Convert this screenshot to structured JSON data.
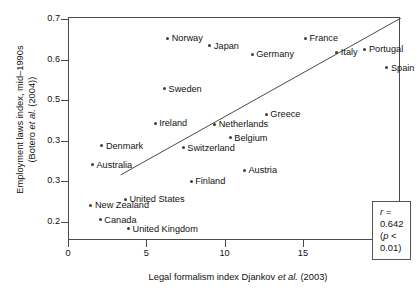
{
  "chart_data": {
    "type": "scatter",
    "title": "",
    "xlabel": "Legal formalism index Djankov et al. (2003)",
    "ylabel_line1": "Employment laws index, mid–1990s",
    "ylabel_line2": "(Botero et al. (2004))",
    "xlim": [
      0,
      21.2
    ],
    "ylim": [
      0.155,
      0.705
    ],
    "xticks": [
      0,
      5,
      10,
      15,
      20
    ],
    "xtick_labels": [
      "0",
      "5",
      "10",
      "15",
      "20"
    ],
    "yticks": [
      0.2,
      0.3,
      0.4,
      0.5,
      0.6,
      0.7
    ],
    "ytick_labels": [
      "0.2",
      "0.3",
      "0.3",
      "0.5",
      "0.6",
      "0.7"
    ],
    "grid": false,
    "legend": null,
    "points": [
      {
        "label": "Norway",
        "x": 6.3,
        "y": 0.655,
        "side": "right"
      },
      {
        "label": "Japan",
        "x": 9.0,
        "y": 0.637,
        "side": "right"
      },
      {
        "label": "France",
        "x": 15.1,
        "y": 0.655,
        "side": "right"
      },
      {
        "label": "Portugal",
        "x": 18.9,
        "y": 0.628,
        "side": "right"
      },
      {
        "label": "Italy",
        "x": 17.1,
        "y": 0.62,
        "side": "right"
      },
      {
        "label": "Germany",
        "x": 11.7,
        "y": 0.615,
        "side": "right"
      },
      {
        "label": "Spain",
        "x": 20.3,
        "y": 0.582,
        "side": "right"
      },
      {
        "label": "Sweden",
        "x": 6.1,
        "y": 0.53,
        "side": "right"
      },
      {
        "label": "Greece",
        "x": 12.6,
        "y": 0.468,
        "side": "right"
      },
      {
        "label": "Ireland",
        "x": 5.5,
        "y": 0.445,
        "side": "right"
      },
      {
        "label": "Netherlands",
        "x": 9.3,
        "y": 0.443,
        "side": "right"
      },
      {
        "label": "Belgium",
        "x": 10.3,
        "y": 0.41,
        "side": "right"
      },
      {
        "label": "Denmark",
        "x": 2.1,
        "y": 0.39,
        "side": "right"
      },
      {
        "label": "Switzerland",
        "x": 7.3,
        "y": 0.385,
        "side": "right"
      },
      {
        "label": "Australia",
        "x": 1.5,
        "y": 0.343,
        "side": "right"
      },
      {
        "label": "Austria",
        "x": 11.2,
        "y": 0.33,
        "side": "right"
      },
      {
        "label": "Finland",
        "x": 7.8,
        "y": 0.302,
        "side": "right"
      },
      {
        "label": "United States",
        "x": 3.6,
        "y": 0.258,
        "side": "right"
      },
      {
        "label": "New Zealand",
        "x": 1.4,
        "y": 0.243,
        "side": "right"
      },
      {
        "label": "Canada",
        "x": 2.0,
        "y": 0.207,
        "side": "right"
      },
      {
        "label": "United Kingdom",
        "x": 3.8,
        "y": 0.185,
        "side": "right"
      }
    ],
    "trendline": {
      "x0": 3.3,
      "y0": 0.318,
      "x1": 21.2,
      "y1": 0.705
    }
  },
  "stats": {
    "r_prefix": "r",
    "r_text": " = 0.642",
    "p_open": "(",
    "p_prefix": "p",
    "p_text": " < 0.01)"
  },
  "axis_titles": {
    "x_main": "Legal formalism index Djankov ",
    "x_italic": "et al.",
    "x_tail": " (2003)",
    "y_line1": "Employment laws index, mid–1990s",
    "y_line2_open": "(Botero ",
    "y_line2_italic": "et al.",
    "y_line2_tail": " (2004))"
  }
}
